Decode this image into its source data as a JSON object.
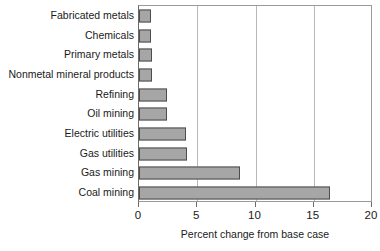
{
  "chart_data": {
    "type": "bar",
    "orientation": "horizontal",
    "title": "",
    "xlabel": "Percent change from base case",
    "ylabel": "",
    "xlim": [
      0,
      20
    ],
    "xticks": [
      0,
      5,
      10,
      15,
      20
    ],
    "xticklabels": [
      "0",
      "5",
      "10",
      "15",
      "20"
    ],
    "grid": "vertical",
    "legend": "none",
    "categories": [
      "Fabricated metals",
      "Chemicals",
      "Primary metals",
      "Nonmetal mineral products",
      "Refining",
      "Oil mining",
      "Electric utilities",
      "Gas utilities",
      "Gas mining",
      "Coal mining"
    ],
    "values": [
      1.0,
      1.0,
      1.1,
      1.1,
      2.4,
      2.4,
      4.0,
      4.1,
      8.7,
      16.4
    ],
    "bar_fill_color": "#a6a6a6",
    "bar_edge_color": "#4d4d4d",
    "gridline_color": "#b8b8b8",
    "axis_color": "#6b6b6b"
  }
}
